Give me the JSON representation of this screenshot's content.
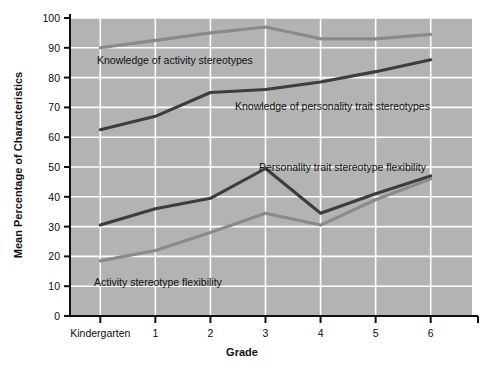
{
  "chart_data": {
    "type": "line",
    "title": "",
    "xlabel": "Grade",
    "ylabel": "Mean Percentage of Characteristics",
    "categories": [
      "Kindergarten",
      "1",
      "2",
      "3",
      "4",
      "5",
      "6"
    ],
    "x": [
      0,
      1,
      2,
      3,
      4,
      5,
      6
    ],
    "ylim": [
      0,
      100
    ],
    "xlim": [
      -0.55,
      6.75
    ],
    "yticks": [
      0,
      10,
      20,
      30,
      40,
      50,
      60,
      70,
      80,
      90,
      100
    ],
    "ytick_labels": [
      "0",
      "10",
      "20",
      "30",
      "40",
      "50",
      "60",
      "70",
      "80",
      "90",
      "100"
    ],
    "grid": true,
    "grid_color": "#ffffff",
    "plot_background": "#b3b3b3",
    "legend": "inline-annotations",
    "series": [
      {
        "name": "Knowledge of activity stereotypes",
        "color": "#8a8a8a",
        "values": [
          90,
          92.5,
          95,
          97,
          93,
          93,
          94.5
        ],
        "annotation": "Knowledge of activity stereotypes"
      },
      {
        "name": "Knowledge of personality trait stereotypes",
        "color": "#3d3d3d",
        "values": [
          62.5,
          67,
          75,
          76,
          78.5,
          82,
          86
        ],
        "annotation": "Knowledge of personality trait stereotypes"
      },
      {
        "name": "Personality trait stereotype flexibility",
        "color": "#3d3d3d",
        "values": [
          30.5,
          36,
          39.5,
          49.5,
          34.5,
          41,
          47
        ],
        "annotation": "Personality trait stereotype flexibility"
      },
      {
        "name": "Activity stereotype flexibility",
        "color": "#8a8a8a",
        "values": [
          18.5,
          22,
          28,
          34.5,
          30.5,
          39,
          46
        ],
        "annotation": "Activity stereotype flexibility"
      }
    ],
    "annotations": [
      {
        "text": "Knowledge of activity stereotypes",
        "x_px": 97,
        "y_px": 64,
        "anchor": "start"
      },
      {
        "text": "Knowledge of personality trait stereotypes",
        "x_px": 235,
        "y_px": 110,
        "anchor": "start"
      },
      {
        "text": "Personality trait stereotype flexibility",
        "x_px": 259,
        "y_px": 171,
        "anchor": "start"
      },
      {
        "text": "Activity stereotype flexibility",
        "x_px": 94,
        "y_px": 286,
        "anchor": "start"
      }
    ]
  },
  "figure": {
    "x_axis_title": "Grade",
    "y_axis_title": "Mean Percentage of Characteristics",
    "border_color": "#111111",
    "page_background": "#ffffff"
  }
}
